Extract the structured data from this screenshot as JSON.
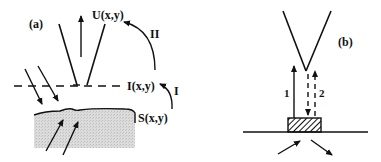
{
  "panel_a": {
    "label": "(a)",
    "U_label": "U(x,y)",
    "I_label": "I(x,y)",
    "S_label": "S(x,y)",
    "path_I": "I",
    "path_II": "II"
  },
  "panel_b": {
    "label": "(b)",
    "beam_1": "1",
    "beam_2": "2"
  },
  "colors": {
    "stroke": "#111111",
    "sample_fill": "#d4d4d4"
  }
}
